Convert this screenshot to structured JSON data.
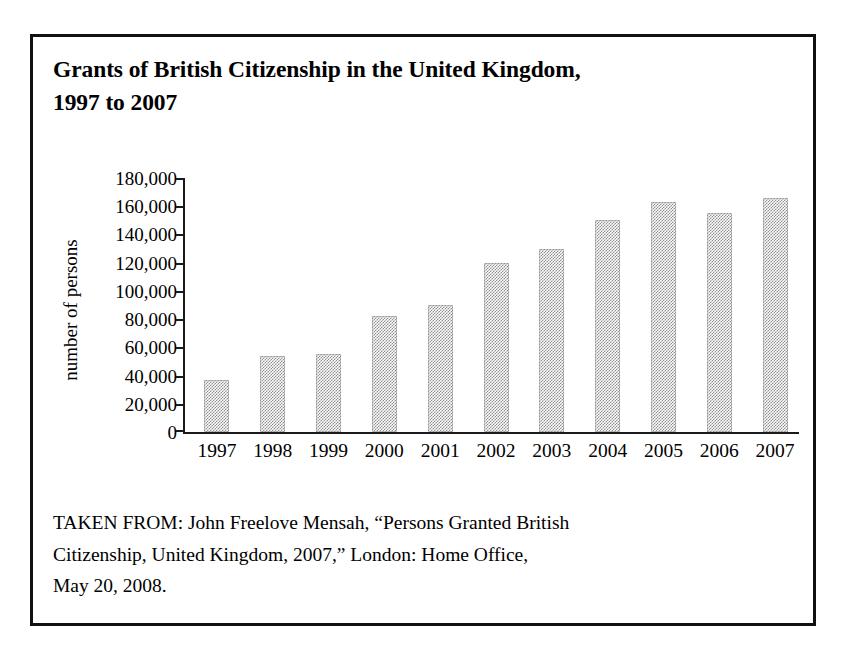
{
  "figure": {
    "title_line_1": "Grants of British Citizenship in the United Kingdom,",
    "title_line_2": "1997 to 2007",
    "source_line_1": "TAKEN FROM: John Freelove Mensah, “Persons Granted British",
    "source_line_2": "Citizenship, United Kingdom, 2007,” London: Home Office,",
    "source_line_3": "May 20, 2008."
  },
  "chart_data": {
    "type": "bar",
    "title": "Grants of British Citizenship in the United Kingdom, 1997 to 2007",
    "xlabel": "",
    "ylabel": "number of persons",
    "categories": [
      "1997",
      "1998",
      "1999",
      "2000",
      "2001",
      "2002",
      "2003",
      "2004",
      "2005",
      "2006",
      "2007"
    ],
    "values": [
      37000,
      54000,
      55000,
      82000,
      90000,
      120000,
      130000,
      150000,
      163000,
      155000,
      166000
    ],
    "ylim": [
      0,
      180000
    ],
    "ytick_step": 20000,
    "ytick_labels": [
      "180,000",
      "160,000",
      "140,000",
      "120,000",
      "100,000",
      "80,000",
      "60,000",
      "40,000",
      "20,000",
      "0"
    ],
    "ytick_values": [
      180000,
      160000,
      140000,
      120000,
      100000,
      80000,
      60000,
      40000,
      20000,
      0
    ],
    "grid": false,
    "legend": false,
    "bar_fill": "#8d8d8d",
    "axis_color": "#1a1a1a"
  }
}
